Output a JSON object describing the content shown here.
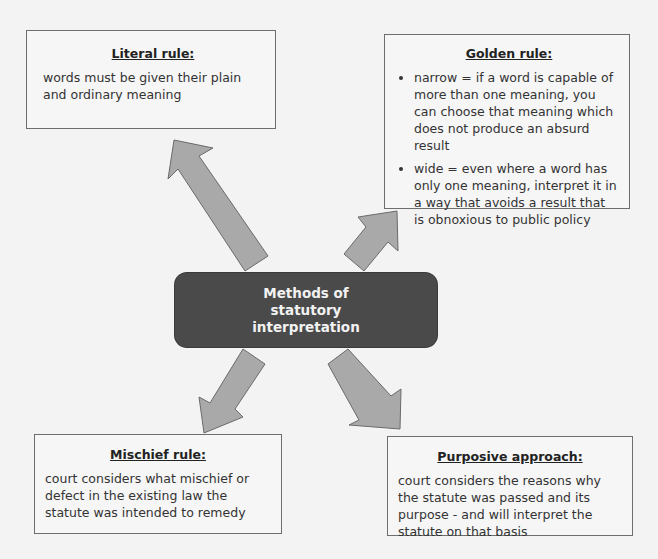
{
  "diagram": {
    "center": {
      "label": "Methods of statutory interpretation",
      "fill": "#4a4a4a",
      "text_color": "#f2f2f2"
    },
    "arrow_fill": "#a9a9a9",
    "boxes": {
      "literal": {
        "title": "Literal rule:",
        "text": "words must be given their plain and ordinary meaning"
      },
      "golden": {
        "title": "Golden rule:",
        "bullets": [
          "narrow = if a word is capable of more than one meaning, you can choose that meaning which does not produce an absurd result",
          "wide = even where a word has only one meaning, interpret it in a way that avoids a result that is obnoxious to public policy"
        ]
      },
      "mischief": {
        "title": "Mischief rule:",
        "text": "court considers what mischief or defect in the existing law the statute was intended to remedy"
      },
      "purposive": {
        "title": "Purposive approach:",
        "text": "court considers the reasons why the statute was passed and its purpose - and will interpret the statute on that basis"
      }
    }
  }
}
